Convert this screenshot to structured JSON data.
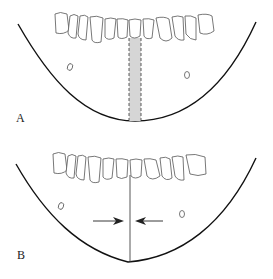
{
  "panels": [
    {
      "label": "A",
      "description": "Mandibular arch with shaded midline zone between dashed lines"
    },
    {
      "label": "B",
      "description": "Mandibular arch with single midline and converging arrows"
    }
  ]
}
